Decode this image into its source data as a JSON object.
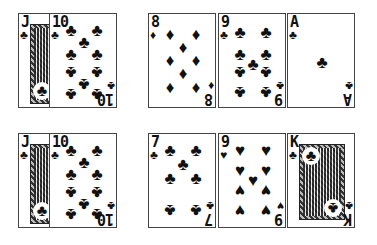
{
  "table": {
    "rows": [
      {
        "groups": [
          {
            "cards": [
              {
                "rank": "J",
                "suit": "♣",
                "name": "jack-of-clubs"
              },
              {
                "rank": "10",
                "suit": "♣",
                "name": "ten-of-clubs"
              }
            ]
          },
          {
            "cards": [
              {
                "rank": "8",
                "suit": "♦",
                "name": "eight-of-diamonds"
              },
              {
                "rank": "9",
                "suit": "♣",
                "name": "nine-of-clubs"
              },
              {
                "rank": "A",
                "suit": "♣",
                "name": "ace-of-clubs"
              }
            ]
          }
        ]
      },
      {
        "groups": [
          {
            "cards": [
              {
                "rank": "J",
                "suit": "♣",
                "name": "jack-of-clubs"
              },
              {
                "rank": "10",
                "suit": "♣",
                "name": "ten-of-clubs"
              }
            ]
          },
          {
            "cards": [
              {
                "rank": "7",
                "suit": "♣",
                "name": "seven-of-clubs"
              },
              {
                "rank": "9",
                "suit": "♥",
                "name": "nine-of-hearts"
              },
              {
                "rank": "K",
                "suit": "♣",
                "name": "king-of-clubs"
              }
            ]
          }
        ]
      }
    ]
  }
}
